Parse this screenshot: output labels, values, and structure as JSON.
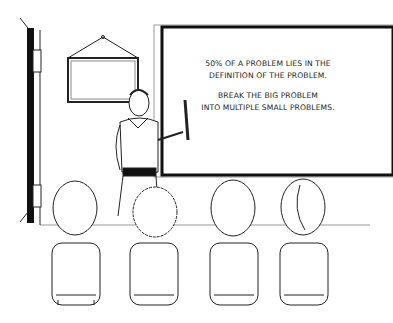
{
  "scene": {
    "description": "Line-art classroom: teacher pointing at a whiteboard, four students seated on chairs seen from behind",
    "board": {
      "line1": "50% OF A PROBLEM LIES IN THE",
      "line2": "DEFINITION OF THE PROBLEM.",
      "line3": "BREAK THE BIG PROBLEM",
      "line4": "INTO MULTIPLE SMALL PROBLEMS."
    },
    "colors": {
      "ink": "#111111",
      "background": "#ffffff",
      "grey": "#888888"
    }
  }
}
